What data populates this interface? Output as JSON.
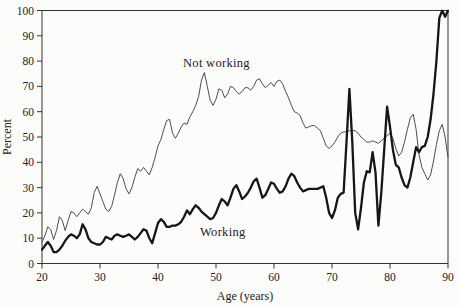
{
  "figure": {
    "background": "#fcfcfa",
    "frame_color": "#333333",
    "text_color": "#222222",
    "not_working_line_color": "#4d4d4d",
    "working_line_color": "#161616"
  },
  "chart_data": {
    "type": "line",
    "title": "",
    "xlabel": "Age (years)",
    "ylabel": "Percent",
    "xlim": [
      20,
      90
    ],
    "ylim": [
      0,
      100
    ],
    "x_ticks": [
      20,
      30,
      40,
      50,
      60,
      70,
      80,
      90
    ],
    "y_ticks": [
      0,
      10,
      20,
      30,
      40,
      50,
      60,
      70,
      80,
      90,
      100
    ],
    "grid": false,
    "legend_position": "inline-annotations",
    "annotations": [
      {
        "text": "Not working",
        "x_age": 44.3,
        "y_percent": 78
      },
      {
        "text": "Working",
        "x_age": 47.3,
        "y_percent": 10.5
      }
    ],
    "x_start": 20,
    "x_step": 0.5,
    "series": [
      {
        "name": "Not working",
        "style": "thin",
        "values": [
          8.5,
          11,
          14.5,
          13.5,
          9.5,
          13,
          18.5,
          17,
          13,
          17,
          20.5,
          20,
          18.5,
          20,
          21.5,
          20.5,
          19.5,
          22,
          28,
          30.5,
          27.5,
          24.5,
          21.5,
          20.5,
          22.5,
          27,
          32,
          35.5,
          33.5,
          29.5,
          27.5,
          30,
          34,
          37.5,
          36.5,
          38,
          36.5,
          35,
          38,
          42,
          46.5,
          49,
          53,
          56.5,
          57,
          51.5,
          49.5,
          51.5,
          54,
          55.5,
          55,
          58,
          60,
          62.5,
          66,
          72.5,
          75.5,
          70,
          64.5,
          62.5,
          65,
          69,
          68.5,
          65.5,
          67,
          70,
          69.5,
          68,
          67,
          68,
          69.5,
          69.5,
          68.5,
          70,
          72.5,
          73,
          71,
          69.5,
          70.5,
          71.5,
          70,
          72,
          72.5,
          71,
          68,
          65.5,
          62.5,
          60,
          59.5,
          58.5,
          55.5,
          53.5,
          54,
          54.5,
          54.5,
          53.5,
          52.5,
          49.5,
          46.5,
          45.5,
          46.5,
          48,
          50,
          51.5,
          52,
          52,
          52.5,
          52.5,
          52.5,
          51.5,
          50,
          49,
          48,
          48,
          48.5,
          48,
          47.5,
          48.5,
          49.5,
          50.5,
          51.5,
          49.5,
          45.5,
          42.5,
          44,
          48,
          53,
          57.5,
          59,
          53,
          43,
          38,
          35.5,
          33,
          35,
          40.5,
          47,
          52.5,
          55,
          50,
          42
        ]
      },
      {
        "name": "Working",
        "style": "thick",
        "values": [
          5.5,
          7,
          8.5,
          7,
          4.5,
          4.5,
          5.5,
          7,
          9,
          10.5,
          11.5,
          11,
          10,
          11.5,
          15.5,
          13.5,
          10,
          8.5,
          8,
          7.5,
          7.5,
          8.5,
          10.5,
          10,
          9.5,
          11,
          11.5,
          11,
          10.5,
          11,
          11.5,
          10.5,
          9.5,
          10.5,
          12,
          13.5,
          13,
          10,
          8,
          12,
          16,
          17.5,
          16.5,
          14.5,
          14.5,
          15,
          15,
          15.5,
          16.5,
          18.5,
          21,
          19.5,
          21.5,
          23,
          22,
          20.5,
          19.5,
          18.5,
          17.5,
          18,
          20,
          23,
          25.5,
          24.5,
          23,
          26,
          29.5,
          31,
          28.5,
          25.5,
          26.5,
          28,
          30,
          32.5,
          33.5,
          30,
          26,
          27,
          29.5,
          32,
          31.5,
          29.5,
          28,
          28.5,
          30.5,
          33.5,
          35.5,
          34.5,
          32,
          30,
          28.5,
          29,
          29.5,
          29.5,
          29.5,
          29.5,
          30,
          30.5,
          26,
          20,
          18,
          21,
          26,
          27.5,
          28,
          48,
          69,
          48,
          20,
          13.5,
          22,
          32,
          36.5,
          36,
          44,
          36,
          15,
          28,
          45,
          62,
          54,
          45,
          39,
          38,
          34,
          31,
          30,
          34,
          40,
          46,
          44,
          46,
          46.5,
          50,
          57,
          67,
          80,
          97,
          100,
          97.5,
          100
        ]
      }
    ]
  }
}
